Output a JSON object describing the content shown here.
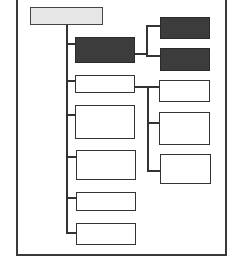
{
  "diagram": {
    "type": "hierarchy-tree",
    "colors": {
      "frame": "#3a3a3a",
      "line": "#333333",
      "dark_fill": "#3c3c3c",
      "light_fill": "#e6e6e6",
      "empty_fill": "#ffffff"
    },
    "nodes": [
      {
        "id": "root",
        "style": "light-dotted",
        "x": 30,
        "y": 7,
        "w": 73,
        "h": 18
      },
      {
        "id": "l1-1",
        "parent": "root",
        "style": "dark",
        "x": 75,
        "y": 37,
        "w": 60,
        "h": 26
      },
      {
        "id": "l1-2",
        "parent": "root",
        "style": "empty",
        "x": 75,
        "y": 75,
        "w": 60,
        "h": 18
      },
      {
        "id": "l1-3",
        "parent": "root",
        "style": "empty",
        "x": 75,
        "y": 105,
        "w": 60,
        "h": 34
      },
      {
        "id": "l1-4",
        "parent": "root",
        "style": "empty",
        "x": 76,
        "y": 150,
        "w": 60,
        "h": 30
      },
      {
        "id": "l1-5",
        "parent": "root",
        "style": "empty",
        "x": 76,
        "y": 192,
        "w": 60,
        "h": 19
      },
      {
        "id": "l1-6",
        "parent": "root",
        "style": "empty",
        "x": 76,
        "y": 223,
        "w": 60,
        "h": 22
      },
      {
        "id": "l2-1",
        "parent": "l1-1",
        "style": "dark",
        "x": 160,
        "y": 17,
        "w": 50,
        "h": 22
      },
      {
        "id": "l2-2",
        "parent": "l1-1",
        "style": "dark",
        "x": 160,
        "y": 48,
        "w": 50,
        "h": 23
      },
      {
        "id": "l2-3",
        "parent": "l1-2",
        "style": "empty",
        "x": 159,
        "y": 80,
        "w": 51,
        "h": 22
      },
      {
        "id": "l2-4",
        "parent": "l1-2",
        "style": "empty",
        "x": 159,
        "y": 112,
        "w": 51,
        "h": 33
      },
      {
        "id": "l2-5",
        "parent": "l1-2",
        "style": "empty",
        "x": 160,
        "y": 154,
        "w": 51,
        "h": 30
      }
    ],
    "labels": []
  }
}
